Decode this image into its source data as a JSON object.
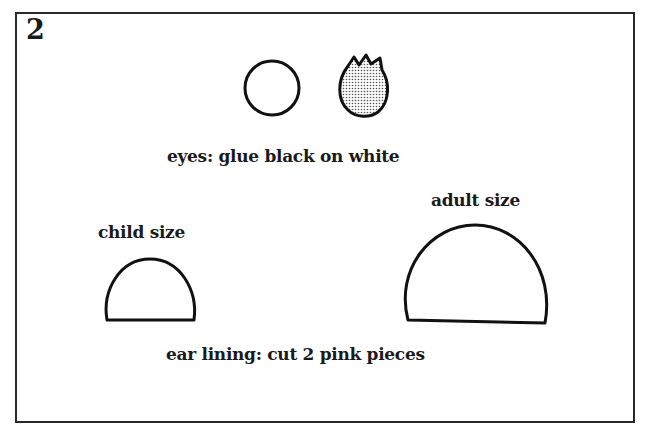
{
  "figure": {
    "number": "2",
    "eyes_caption": "eyes: glue black on white",
    "child_label": "child size",
    "adult_label": "adult size",
    "ear_caption": "ear lining: cut 2 pink pieces"
  },
  "shapes": {
    "eye_white": "white-circle",
    "eye_black": "dotted-flame-shape",
    "ear_child": "half-dome-small",
    "ear_adult": "half-dome-large"
  }
}
